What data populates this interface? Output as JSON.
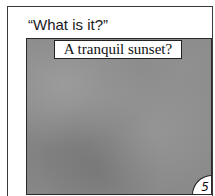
{
  "panel": {
    "question": "“What is it?”",
    "image": {
      "caption": "A tranquil sunset?",
      "page_number": "5"
    }
  }
}
